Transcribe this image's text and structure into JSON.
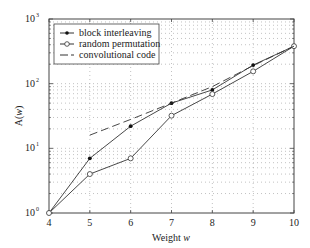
{
  "chart_data": {
    "type": "line",
    "title": "",
    "xlabel": "Weight w",
    "ylabel": "A(w)",
    "yscale": "log",
    "xlim": [
      4,
      10
    ],
    "ylim": [
      1,
      1000
    ],
    "grid": true,
    "legend_position": "upper left",
    "x": [
      4,
      5,
      6,
      7,
      8,
      9,
      10
    ],
    "xticks": [
      "4",
      "5",
      "6",
      "7",
      "8",
      "9",
      "10"
    ],
    "yticks": [
      "10^0",
      "10^1",
      "10^2",
      "10^3"
    ],
    "series": [
      {
        "name": "block interleaving",
        "marker": "filled-dot",
        "style": "solid",
        "x": [
          4,
          5,
          6,
          7,
          8,
          9,
          10
        ],
        "values": [
          1,
          7,
          22,
          50,
          80,
          194,
          380
        ]
      },
      {
        "name": "random permutation",
        "marker": "open-circle",
        "style": "solid",
        "x": [
          4,
          5,
          6,
          7,
          8,
          9,
          10
        ],
        "values": [
          1,
          4,
          7,
          32,
          69,
          155,
          380
        ]
      },
      {
        "name": "convolutional code",
        "marker": "none",
        "style": "dashed",
        "x": [
          5,
          6,
          7,
          8,
          9,
          10
        ],
        "values": [
          16,
          28,
          50,
          90,
          190,
          380
        ]
      }
    ]
  },
  "legend": {
    "items": [
      "block interleaving",
      "random permutation",
      "convolutional code"
    ]
  },
  "axes": {
    "xlabel_main": "Weight",
    "xlabel_var": "w",
    "ylabel_main": "A(",
    "ylabel_var": "w",
    "ylabel_end": ")"
  }
}
